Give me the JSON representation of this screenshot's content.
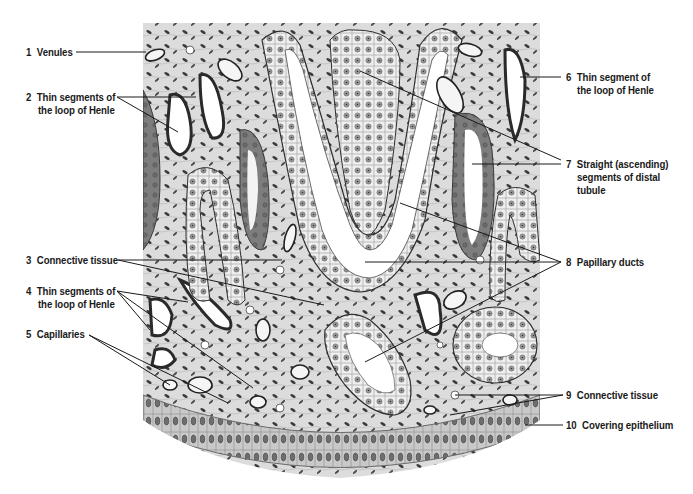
{
  "figure": {
    "colors": {
      "background": "#ffffff",
      "stroma": "#d9d9d9",
      "stroma_light": "#e8e8e8",
      "cell_fill": "#eeeeee",
      "dark_tubule": "#7a7a7a",
      "nucleus": "#8c8c8c",
      "ink": "#1a1a1a",
      "lumen": "#ffffff"
    }
  },
  "labels": [
    {
      "id": 1,
      "num": "1",
      "lines": [
        "Venules"
      ],
      "side": "left"
    },
    {
      "id": 2,
      "num": "2",
      "lines": [
        "Thin segments of",
        "the loop of Henle"
      ],
      "side": "left"
    },
    {
      "id": 3,
      "num": "3",
      "lines": [
        "Connective tissue"
      ],
      "side": "left"
    },
    {
      "id": 4,
      "num": "4",
      "lines": [
        "Thin segments of",
        "the loop of Henle"
      ],
      "side": "left"
    },
    {
      "id": 5,
      "num": "5",
      "lines": [
        "Capillaries"
      ],
      "side": "left"
    },
    {
      "id": 6,
      "num": "6",
      "lines": [
        "Thin segment of",
        "the loop of Henle"
      ],
      "side": "right"
    },
    {
      "id": 7,
      "num": "7",
      "lines": [
        "Straight (ascending)",
        "segments of distal",
        "tubule"
      ],
      "side": "right"
    },
    {
      "id": 8,
      "num": "8",
      "lines": [
        "Papillary ducts"
      ],
      "side": "right"
    },
    {
      "id": 9,
      "num": "9",
      "lines": [
        "Connective tissue"
      ],
      "side": "right"
    },
    {
      "id": 10,
      "num": "10",
      "lines": [
        "Covering epithelium"
      ],
      "side": "right"
    }
  ]
}
